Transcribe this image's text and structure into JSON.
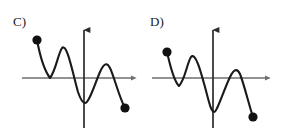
{
  "figure": {
    "background_color": "#ffffff",
    "panel_count": 2,
    "axis_color": "#6e6e6e",
    "curve_color": "#1a1a1a",
    "endpoint_color": "#111111"
  },
  "panels": [
    {
      "id": "c",
      "label": "C)",
      "label_x": 13,
      "label_y": 15,
      "axis": {
        "x_axis_y": 78,
        "x_axis_start": 22,
        "x_axis_end": 138,
        "y_axis_x": 84,
        "y_axis_top": 23,
        "y_axis_bottom": 128,
        "arrow_right": true,
        "arrow_up": true,
        "x_arrow_label": "right-arrow",
        "y_arrow_label": "up-arrow"
      },
      "curve_path": "M 37,40 C 40,56 44,70 50,78 C 56,70 58,54 62,48 C 67,43 72,70 78,92 C 81,101 83,103 85,103 C 89,103 94,86 100,72 C 104,63 107,62 110,68 C 114,76 119,97 125,108",
      "endpoints": [
        {
          "name": "start-point",
          "x": 37,
          "y": 40,
          "r": 4.6
        },
        {
          "name": "end-point",
          "x": 125,
          "y": 108,
          "r": 4.6
        }
      ],
      "description": "Curve starts upper-left, touches x-axis tangentially at first trough, rises to local max, plunges to deep minimum at the y-axis, rises to local max above axis, then falls to end point below axis."
    },
    {
      "id": "d",
      "label": "D)",
      "label_x": 9,
      "label_y": 15,
      "axis": {
        "x_axis_y": 78,
        "x_axis_start": 11,
        "x_axis_end": 131,
        "y_axis_x": 72,
        "y_axis_top": 23,
        "y_axis_bottom": 128,
        "arrow_right": true,
        "arrow_up": true,
        "x_arrow_label": "right-arrow",
        "y_arrow_label": "up-arrow"
      },
      "curve_path": "M 26,52 C 29,64 32,80 38,86 C 44,80 46,63 50,57 C 55,51 61,76 68,102 C 70,110 72,112 73,112 C 76,112 82,92 89,77 C 93,69 96,68 99,74 C 103,84 108,105 112,117",
      "endpoints": [
        {
          "name": "start-point",
          "x": 26,
          "y": 52,
          "r": 4.6
        },
        {
          "name": "end-point",
          "x": 112,
          "y": 117,
          "r": 4.6
        }
      ],
      "description": "Curve starts upper-left, dips below the x-axis at the first trough (crossing it), rises to local max, plunges to deep minimum at the y-axis, rises to local max above axis, then falls to end point below axis."
    }
  ],
  "chart_data": {
    "type": "line",
    "title": "",
    "subtitle": "",
    "xlabel": "",
    "ylabel": "",
    "grid": false,
    "legend": null,
    "axis_style": "arrowed-cartesian-axes-no-ticks",
    "tick_labels_x": [],
    "tick_labels_y": [],
    "series": [
      {
        "name": "C)",
        "panel": "c",
        "marker_endpoints": true,
        "annotations": [
          "C)"
        ],
        "critical_points": [
          {
            "kind": "endpoint",
            "x": 37,
            "y": 40,
            "relation_to_x_axis": "above"
          },
          {
            "kind": "minimum",
            "x": 50,
            "y": 78,
            "relation_to_x_axis": "tangent"
          },
          {
            "kind": "maximum",
            "x": 62,
            "y": 48,
            "relation_to_x_axis": "above"
          },
          {
            "kind": "minimum",
            "x": 85,
            "y": 103,
            "relation_to_x_axis": "below"
          },
          {
            "kind": "maximum",
            "x": 110,
            "y": 64,
            "relation_to_x_axis": "above"
          },
          {
            "kind": "endpoint",
            "x": 125,
            "y": 108,
            "relation_to_x_axis": "below"
          }
        ]
      },
      {
        "name": "D)",
        "panel": "d",
        "marker_endpoints": true,
        "annotations": [
          "D)"
        ],
        "critical_points": [
          {
            "kind": "endpoint",
            "x": 26,
            "y": 52,
            "relation_to_x_axis": "above"
          },
          {
            "kind": "minimum",
            "x": 38,
            "y": 86,
            "relation_to_x_axis": "below"
          },
          {
            "kind": "maximum",
            "x": 50,
            "y": 57,
            "relation_to_x_axis": "above"
          },
          {
            "kind": "minimum",
            "x": 73,
            "y": 112,
            "relation_to_x_axis": "below"
          },
          {
            "kind": "maximum",
            "x": 99,
            "y": 68,
            "relation_to_x_axis": "above"
          },
          {
            "kind": "endpoint",
            "x": 112,
            "y": 117,
            "relation_to_x_axis": "below"
          }
        ]
      }
    ]
  }
}
